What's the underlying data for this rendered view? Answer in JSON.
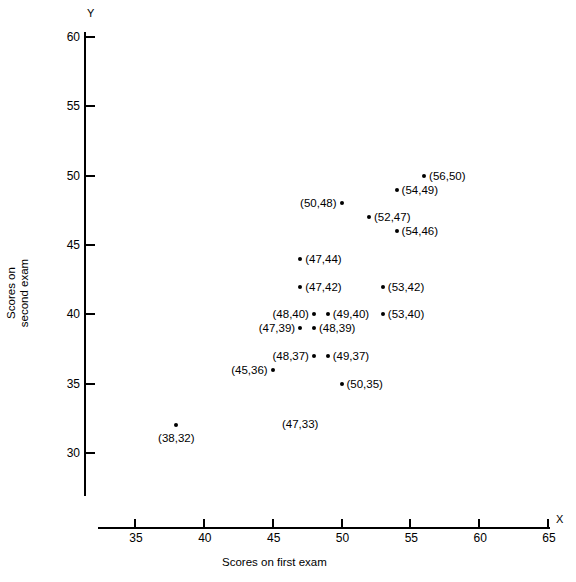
{
  "chart_data": {
    "type": "scatter",
    "title": "",
    "xlabel": "Scores on first exam",
    "ylabel": "Scores on second exam",
    "x_axis_letter": "X",
    "y_axis_letter": "Y",
    "xlim": [
      33,
      65
    ],
    "ylim": [
      27.5,
      60
    ],
    "xticks": [
      35,
      40,
      45,
      50,
      55,
      60,
      65
    ],
    "yticks": [
      30,
      35,
      40,
      45,
      50,
      55,
      60
    ],
    "xtick_labels": [
      "35",
      "40",
      "45",
      "50",
      "55",
      "60",
      "65"
    ],
    "ytick_labels": [
      "30",
      "35",
      "40",
      "45",
      "50",
      "55",
      "60"
    ],
    "grid": false,
    "legend": null,
    "points": [
      {
        "x": 56,
        "y": 50,
        "label": "(56,50)",
        "label_side": "right"
      },
      {
        "x": 54,
        "y": 49,
        "label": "(54,49)",
        "label_side": "right"
      },
      {
        "x": 50,
        "y": 48,
        "label": "(50,48)",
        "label_side": "left"
      },
      {
        "x": 52,
        "y": 47,
        "label": "(52,47)",
        "label_side": "right"
      },
      {
        "x": 54,
        "y": 46,
        "label": "(54,46)",
        "label_side": "right"
      },
      {
        "x": 47,
        "y": 44,
        "label": "(47,44)",
        "label_side": "right"
      },
      {
        "x": 47,
        "y": 42,
        "label": "(47,42)",
        "label_side": "right"
      },
      {
        "x": 53,
        "y": 42,
        "label": "(53,42)",
        "label_side": "right"
      },
      {
        "x": 48,
        "y": 40,
        "label": "(48,40)",
        "label_side": "left"
      },
      {
        "x": 49,
        "y": 40,
        "label": "(49,40)",
        "label_side": "right"
      },
      {
        "x": 53,
        "y": 40,
        "label": "(53,40)",
        "label_side": "right"
      },
      {
        "x": 47,
        "y": 39,
        "label": "(47,39)",
        "label_side": "left"
      },
      {
        "x": 48,
        "y": 39,
        "label": "(48,39)",
        "label_side": "right"
      },
      {
        "x": 48,
        "y": 37,
        "label": "(48,37)",
        "label_side": "left"
      },
      {
        "x": 49,
        "y": 37,
        "label": "(49,37)",
        "label_side": "right"
      },
      {
        "x": 45,
        "y": 36,
        "label": "(45,36)",
        "label_side": "left"
      },
      {
        "x": 50,
        "y": 35,
        "label": "(50,35)",
        "label_side": "right"
      },
      {
        "x": 47,
        "y": 33,
        "label": "(47,33)",
        "label_side": "below"
      },
      {
        "x": 38,
        "y": 32,
        "label": "(38,32)",
        "label_side": "below"
      }
    ]
  }
}
